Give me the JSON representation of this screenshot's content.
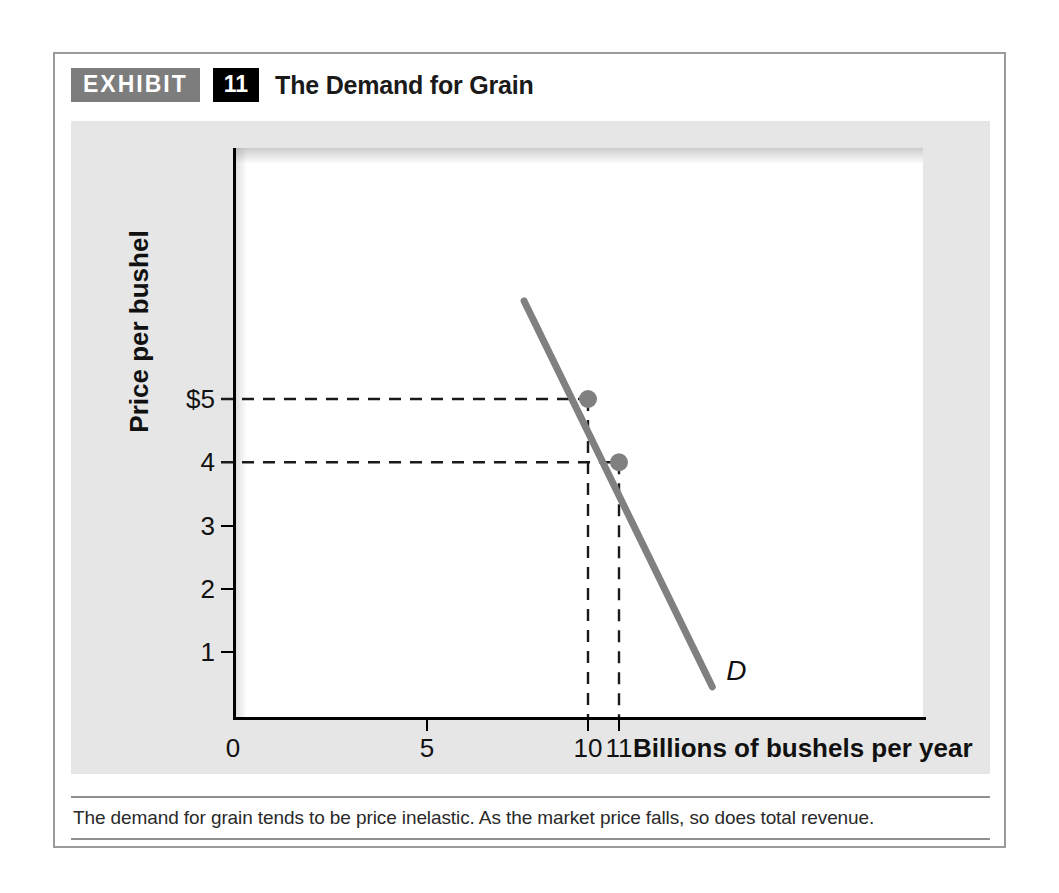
{
  "header": {
    "badge_label": "EXHIBIT",
    "number_label": "11",
    "title": "The Demand for Grain"
  },
  "caption": {
    "text": "The demand for grain tends to be price inelastic. As the market price falls, so does total revenue."
  },
  "colors": {
    "panel_background": "#e6e6e6",
    "plot_background": "#ffffff",
    "curve": "#808080",
    "point": "#808080",
    "axis": "#000000",
    "badge_gray": "#7d7d7d",
    "badge_black": "#000000",
    "frame_border": "#9a9a9a"
  },
  "chart_data": {
    "type": "line",
    "title": "The Demand for Grain",
    "xlabel": "Billions of bushels per year",
    "ylabel": "Price per bushel",
    "xlim": [
      0,
      16
    ],
    "ylim": [
      0,
      7
    ],
    "grid": false,
    "legend": false,
    "x_tick_values": [
      0,
      5,
      10,
      11
    ],
    "x_tick_labels": [
      "0",
      "5",
      "10",
      "11"
    ],
    "y_tick_values": [
      1,
      2,
      3,
      4,
      5
    ],
    "y_tick_labels": [
      "1",
      "2",
      "3",
      "4",
      "$5"
    ],
    "series": [
      {
        "name": "D",
        "label": "D",
        "annotation": "D",
        "x": [
          8.2,
          13.5
        ],
        "y": [
          6.55,
          0.45
        ]
      }
    ],
    "points": [
      {
        "label": "A",
        "x": 10,
        "y": 5,
        "price_label": "$5",
        "quantity_label": "10"
      },
      {
        "label": "B",
        "x": 11,
        "y": 4,
        "price_label": "4",
        "quantity_label": "11"
      }
    ],
    "guide_lines": [
      {
        "from_axis": "y",
        "value": 5,
        "to_x": 10
      },
      {
        "from_axis": "y",
        "value": 4,
        "to_x": 11
      },
      {
        "from_axis": "x",
        "value": 10,
        "to_y": 5
      },
      {
        "from_axis": "x",
        "value": 11,
        "to_y": 4
      }
    ]
  }
}
